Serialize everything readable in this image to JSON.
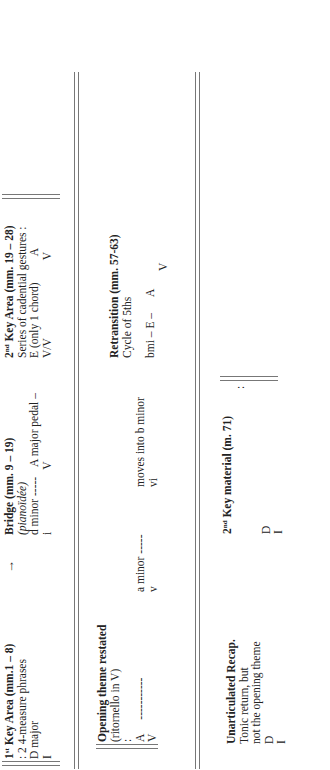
{
  "row1": {
    "first_key_area": {
      "title_sup": "st",
      "title_pre": "1",
      "title_rest": " Key Area (mm.1 – 8)",
      "line2": ": 2   4-measure phrases",
      "line3": "D major",
      "line4": "I"
    },
    "arrow": "→",
    "bridge": {
      "title": "Bridge (mm. 9 – 19)",
      "subtitle": "(pianoïdée)",
      "key_left": "d minor -----",
      "key_right": "A major pedal –",
      "roman_left": "i",
      "roman_right": "V"
    },
    "second_key_area": {
      "title_pre": "2",
      "title_sup": "nd",
      "title_rest": " Key Area (mm. 19 – 28)",
      "line2": "Series of cadential gestures :",
      "key_left": "E (only 1 chord)",
      "key_right": "A",
      "roman_left": "V/V",
      "roman_right": "V"
    }
  },
  "row2": {
    "opening_theme": {
      "title": "Opening theme restated",
      "subtitle": "(ritornello in V)",
      "repeat_mark": ":",
      "key": "A",
      "dashes": "-----------",
      "roman": "V"
    },
    "a_minor": {
      "key": "a minor -----",
      "roman": "v"
    },
    "b_minor": {
      "key": "moves into b minor",
      "roman": "vi"
    },
    "retransition": {
      "title": "Retransition (mm. 57-63)",
      "subtitle": "Cycle of 5ths",
      "chain": "bmi –   E –",
      "key_right": "A",
      "roman_right": "V"
    }
  },
  "row3": {
    "recap": {
      "title": "Unarticulated Recap.",
      "line2": "Tonic return, but",
      "line3": "not the opening theme",
      "key": "D",
      "roman": "I"
    },
    "second_key_material": {
      "title_pre": "2",
      "title_sup": "nd",
      "title_rest": " Key material (m. 71)",
      "key": "D",
      "roman": "I",
      "repeat_mark": ":"
    }
  }
}
